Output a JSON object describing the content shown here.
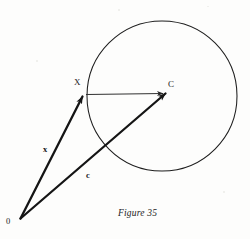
{
  "figure": {
    "caption": "Figure 35",
    "background_color": "#fdfdfc",
    "ink_color": "#1b1b1b",
    "labels": {
      "point_x": "X",
      "point_c": "C",
      "origin": "0",
      "vector_x": "x",
      "vector_c": "c"
    },
    "geometry": {
      "circle": {
        "center_x": 162,
        "center_y": 96,
        "radius": 75,
        "left": 87,
        "right": 237,
        "top": 21,
        "bottom": 171,
        "stroke_width": 1
      },
      "origin_point": {
        "x": 20,
        "y": 219
      },
      "point_x": {
        "x": 83,
        "y": 96
      },
      "point_c": {
        "x": 166,
        "y": 93
      },
      "vector_x_arrow": {
        "from_x": 20,
        "from_y": 219,
        "to_x": 83,
        "to_y": 96
      },
      "vector_c_arrow": {
        "from_x": 20,
        "from_y": 219,
        "to_x": 166,
        "to_y": 93
      },
      "radius_segment": {
        "from_x": 85,
        "from_y": 94,
        "to_x": 164,
        "to_y": 93
      }
    }
  }
}
